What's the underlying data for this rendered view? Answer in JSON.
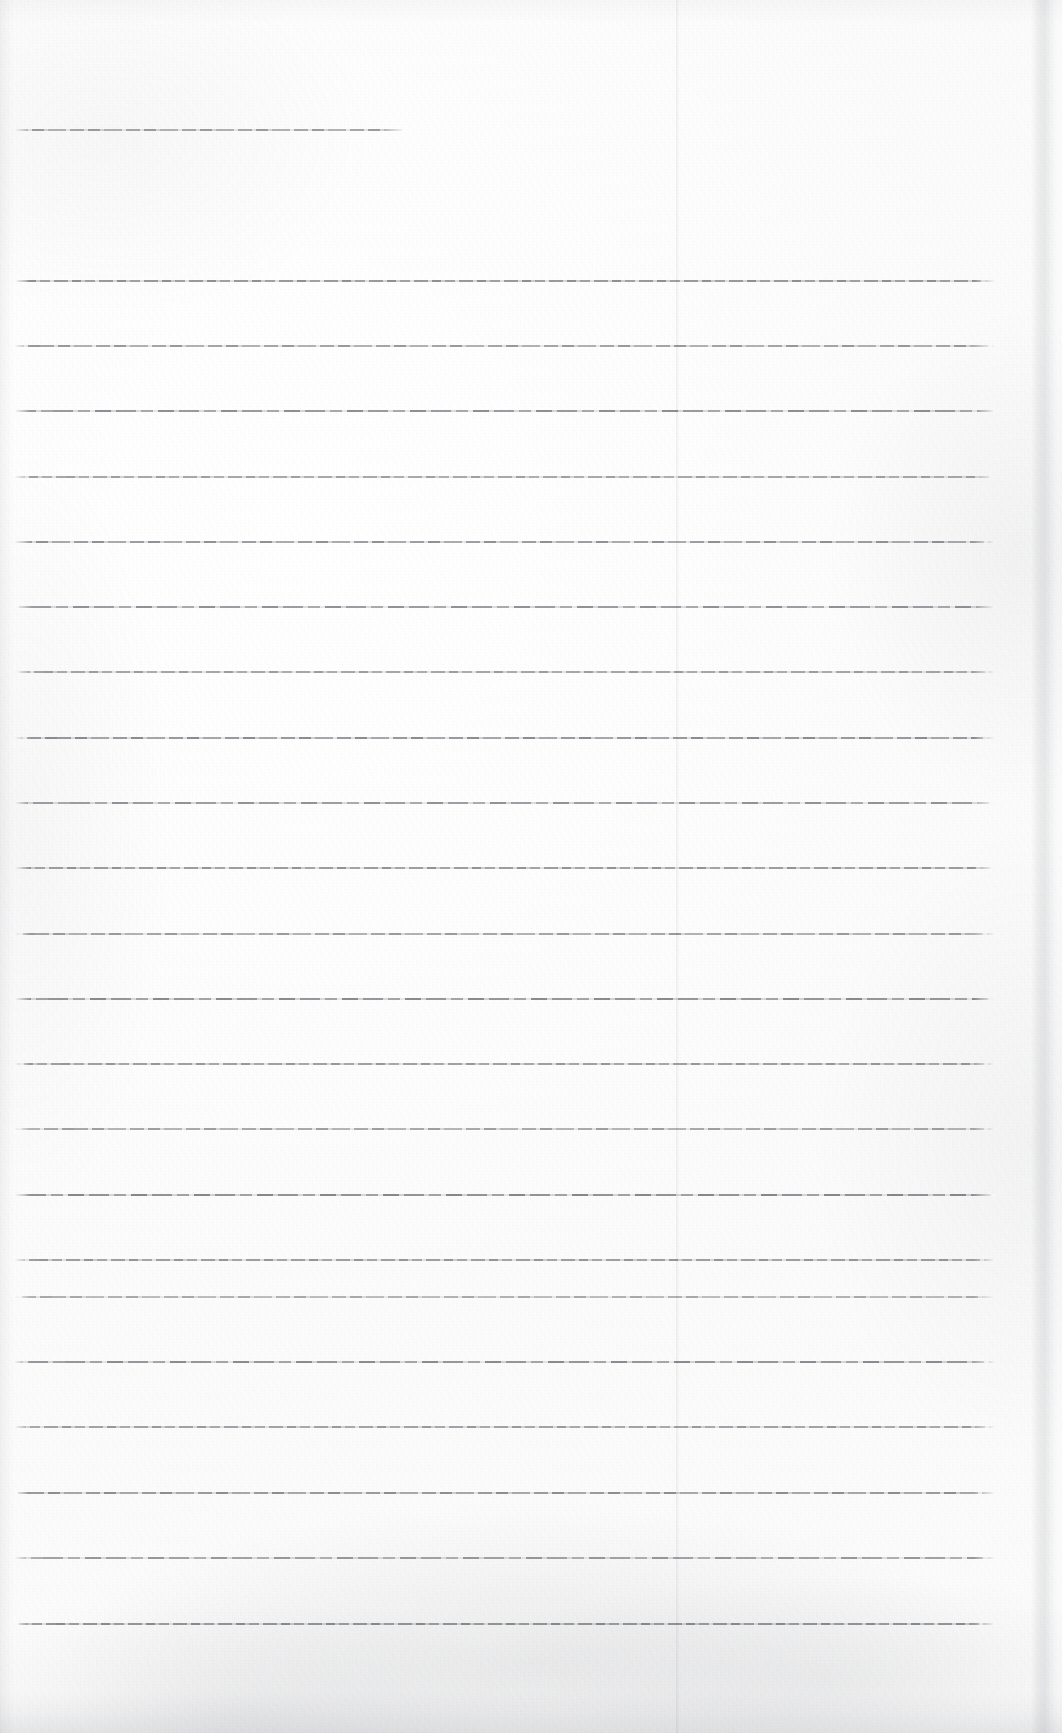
{
  "document": {
    "kind": "scanned-lined-notebook-page",
    "title": "Blank Lined Notebook Page",
    "page_width": 1062,
    "page_height": 1733,
    "paper_color": "#fdfdfd",
    "rule_color": "#6e7177",
    "text_content": "",
    "has_handwriting": false,
    "has_printed_text": false
  },
  "rules": {
    "header_rule": {
      "name": "header-rule",
      "y": 130,
      "x_start": 14,
      "x_end": 406,
      "thickness": 1.6,
      "opacity": 0.72
    },
    "body": {
      "x_start": 14,
      "x_end": 996,
      "first_y": 281,
      "spacing": 65.3,
      "count": 21,
      "thickness": 1.8,
      "lines": [
        {
          "index": 1,
          "y": 281,
          "opacity": 0.82,
          "variant": "v1"
        },
        {
          "index": 2,
          "y": 346,
          "opacity": 0.74,
          "variant": "v2"
        },
        {
          "index": 3,
          "y": 411,
          "opacity": 0.78,
          "variant": "v3"
        },
        {
          "index": 4,
          "y": 477,
          "opacity": 0.7,
          "variant": "v1"
        },
        {
          "index": 5,
          "y": 542,
          "opacity": 0.8,
          "variant": "v2"
        },
        {
          "index": 6,
          "y": 607,
          "opacity": 0.76,
          "variant": "v3"
        },
        {
          "index": 7,
          "y": 672,
          "opacity": 0.72,
          "variant": "v1"
        },
        {
          "index": 8,
          "y": 738,
          "opacity": 0.84,
          "variant": "v2"
        },
        {
          "index": 9,
          "y": 803,
          "opacity": 0.75,
          "variant": "v3"
        },
        {
          "index": 10,
          "y": 868,
          "opacity": 0.79,
          "variant": "v1"
        },
        {
          "index": 11,
          "y": 934,
          "opacity": 0.73,
          "variant": "v2"
        },
        {
          "index": 12,
          "y": 999,
          "opacity": 0.81,
          "variant": "v3"
        },
        {
          "index": 13,
          "y": 1064,
          "opacity": 0.76,
          "variant": "v1"
        },
        {
          "index": 14,
          "y": 1129,
          "opacity": 0.7,
          "variant": "v2"
        },
        {
          "index": 15,
          "y": 1195,
          "opacity": 0.83,
          "variant": "v3"
        },
        {
          "index": 16,
          "y": 1260,
          "opacity": 0.77,
          "variant": "v1"
        },
        {
          "index": 17,
          "y": 1297,
          "opacity": 0.62,
          "variant": "v2"
        },
        {
          "index": 18,
          "y": 1362,
          "opacity": 0.8,
          "variant": "v3"
        },
        {
          "index": 19,
          "y": 1427,
          "opacity": 0.74,
          "variant": "v1"
        },
        {
          "index": 20,
          "y": 1493,
          "opacity": 0.82,
          "variant": "v2"
        },
        {
          "index": 21,
          "y": 1558,
          "opacity": 0.71,
          "variant": "v3"
        },
        {
          "index": 22,
          "y": 1624,
          "opacity": 0.85,
          "variant": "v1"
        }
      ]
    }
  },
  "artifacts": {
    "scan_seam": {
      "name": "scan-seam",
      "x": 676,
      "width": 3
    },
    "right_edge_band": {
      "name": "right-edge-scan-band",
      "x": 1031,
      "width": 26
    },
    "left_edge_band": {
      "name": "left-edge-scan-band",
      "x": 0,
      "width": 14
    },
    "bottom_shadow": {
      "name": "bottom-edge-shadow",
      "height": 40
    },
    "top_shadow": {
      "name": "top-edge-shadow",
      "height": 22
    }
  }
}
